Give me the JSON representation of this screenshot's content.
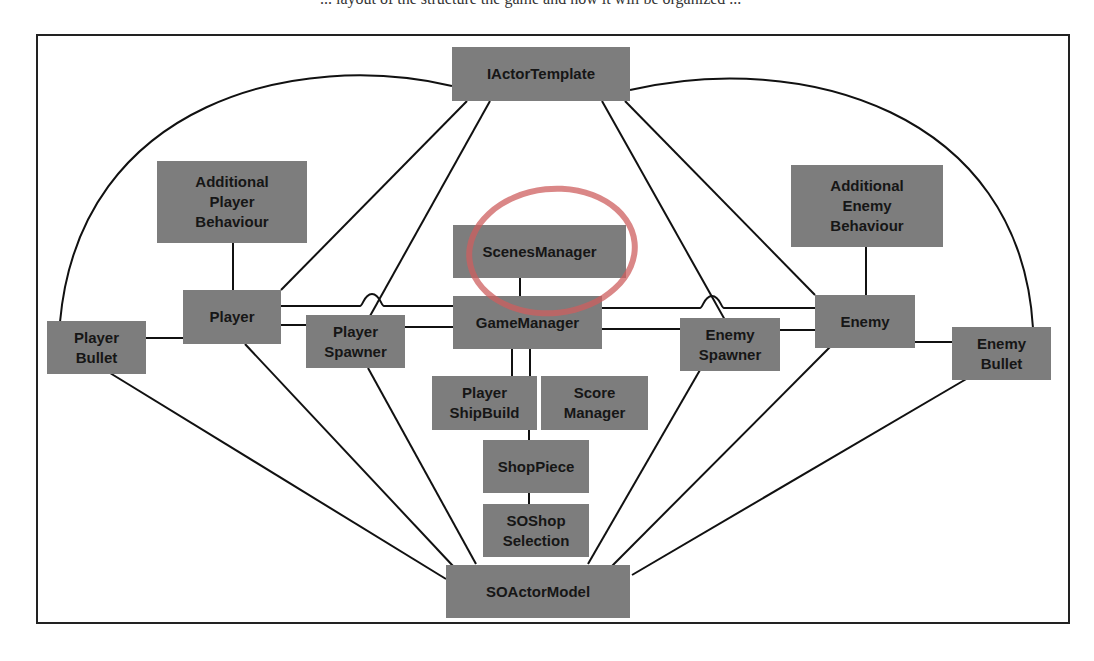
{
  "caption": "... layout of the structure the game and how it will be organized ...",
  "diagram": {
    "nodes": {
      "iactor_template": "IActorTemplate",
      "additional_player_behaviour": "Additional\nPlayer\nBehaviour",
      "additional_enemy_behaviour": "Additional\nEnemy\nBehaviour",
      "scenes_manager": "ScenesManager",
      "player": "Player",
      "player_bullet": "Player\nBullet",
      "player_spawner": "Player\nSpawner",
      "game_manager": "GameManager",
      "enemy_spawner": "Enemy\nSpawner",
      "enemy": "Enemy",
      "enemy_bullet": "Enemy\nBullet",
      "player_ship_build": "Player\nShipBuild",
      "score_manager": "Score\nManager",
      "shop_piece": "ShopPiece",
      "so_shop_selection": "SOShop\nSelection",
      "so_actor_model": "SOActorModel"
    },
    "colors": {
      "node_fill": "#7d7d7d",
      "node_text": "#161616",
      "line": "#111111",
      "highlight_ring": "#cd5f5f"
    }
  }
}
